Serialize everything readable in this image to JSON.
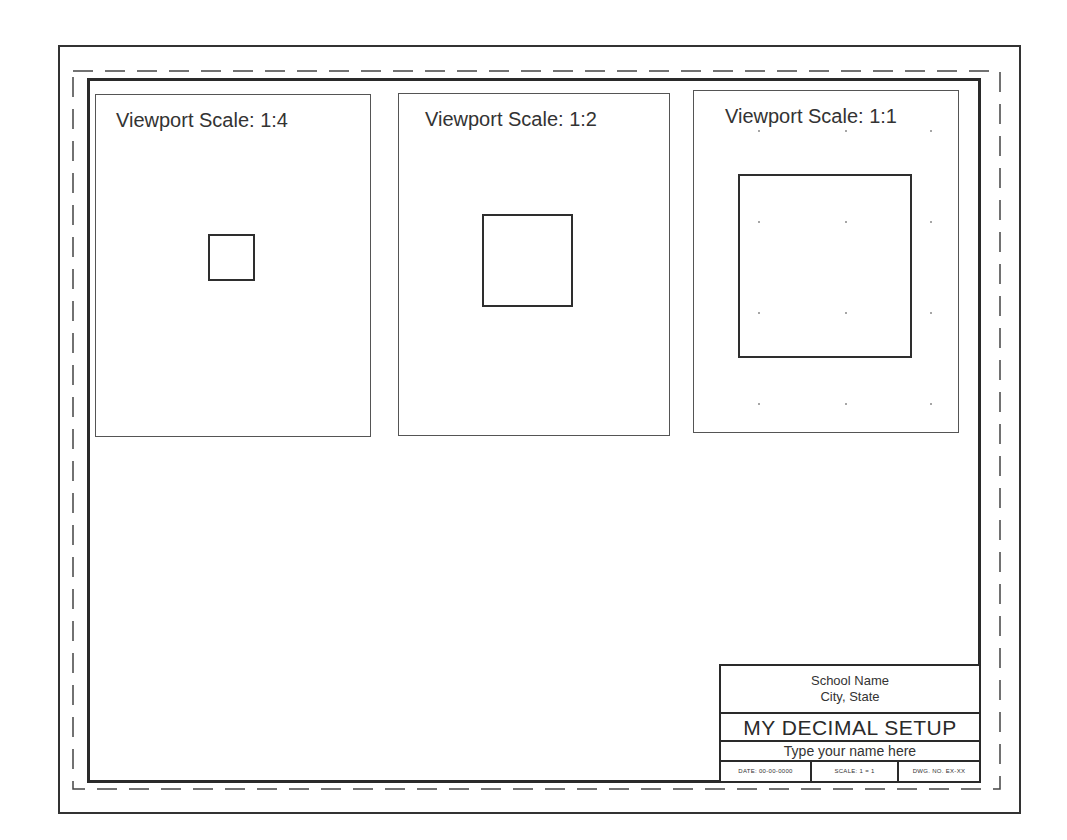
{
  "drawing": {
    "frame_color": "#2a2a2a",
    "viewports": [
      {
        "title": "Viewport Scale: 1:4",
        "scale": "1:4",
        "box": {
          "left": 95,
          "top": 94,
          "width": 276,
          "height": 343
        },
        "title_left": 20,
        "square": {
          "left": 208,
          "top": 234,
          "width": 47,
          "height": 47
        },
        "grid_dots": []
      },
      {
        "title": "Viewport Scale: 1:2",
        "scale": "1:2",
        "box": {
          "left": 398,
          "top": 93,
          "width": 272,
          "height": 343
        },
        "title_left": 26,
        "square": {
          "left": 482,
          "top": 214,
          "width": 91,
          "height": 93
        },
        "grid_dots": []
      },
      {
        "title": "Viewport Scale: 1:1",
        "scale": "1:1",
        "box": {
          "left": 693,
          "top": 90,
          "width": 266,
          "height": 343
        },
        "title_left": 31,
        "square": {
          "left": 738,
          "top": 174,
          "width": 174,
          "height": 184
        },
        "grid_dots": [
          {
            "x": 758,
            "y": 130
          },
          {
            "x": 845,
            "y": 130
          },
          {
            "x": 930,
            "y": 130
          },
          {
            "x": 758,
            "y": 221
          },
          {
            "x": 845,
            "y": 221
          },
          {
            "x": 930,
            "y": 221
          },
          {
            "x": 758,
            "y": 312
          },
          {
            "x": 845,
            "y": 312
          },
          {
            "x": 930,
            "y": 312
          },
          {
            "x": 758,
            "y": 403
          },
          {
            "x": 845,
            "y": 403
          },
          {
            "x": 930,
            "y": 403
          }
        ]
      }
    ]
  },
  "title_block": {
    "school_name": "School Name",
    "city_state": "City, State",
    "drawing_title": "MY DECIMAL SETUP",
    "student_name": "Type your name here",
    "footer": {
      "date": "DATE: 00-00-0000",
      "scale": "SCALE: 1 = 1",
      "drawing_number": "DWG. NO. EX-XX"
    }
  }
}
